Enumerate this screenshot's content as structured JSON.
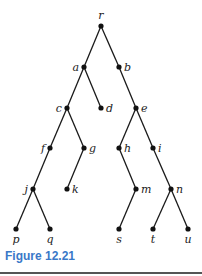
{
  "figure": {
    "caption": "Figure 12.21",
    "caption_color": "#3a78c8"
  },
  "tree": {
    "root": "r",
    "nodes": [
      {
        "id": "r",
        "x": 101,
        "y": 26,
        "label_pos": "above"
      },
      {
        "id": "a",
        "x": 84,
        "y": 67,
        "label_pos": "left"
      },
      {
        "id": "b",
        "x": 119,
        "y": 67,
        "label_pos": "right"
      },
      {
        "id": "c",
        "x": 67,
        "y": 108,
        "label_pos": "left"
      },
      {
        "id": "d",
        "x": 101,
        "y": 108,
        "label_pos": "right"
      },
      {
        "id": "e",
        "x": 136,
        "y": 108,
        "label_pos": "right"
      },
      {
        "id": "f",
        "x": 50,
        "y": 148,
        "label_pos": "left"
      },
      {
        "id": "g",
        "x": 84,
        "y": 148,
        "label_pos": "right"
      },
      {
        "id": "h",
        "x": 119,
        "y": 148,
        "label_pos": "right"
      },
      {
        "id": "i",
        "x": 153,
        "y": 148,
        "label_pos": "right"
      },
      {
        "id": "j",
        "x": 33,
        "y": 189,
        "label_pos": "left"
      },
      {
        "id": "k",
        "x": 67,
        "y": 189,
        "label_pos": "right"
      },
      {
        "id": "m",
        "x": 136,
        "y": 189,
        "label_pos": "right"
      },
      {
        "id": "n",
        "x": 171,
        "y": 189,
        "label_pos": "right"
      },
      {
        "id": "p",
        "x": 16,
        "y": 229,
        "label_pos": "below"
      },
      {
        "id": "q",
        "x": 50,
        "y": 229,
        "label_pos": "below"
      },
      {
        "id": "s",
        "x": 119,
        "y": 229,
        "label_pos": "below"
      },
      {
        "id": "t",
        "x": 153,
        "y": 229,
        "label_pos": "below"
      },
      {
        "id": "u",
        "x": 188,
        "y": 229,
        "label_pos": "below"
      }
    ],
    "edges": [
      [
        "r",
        "a"
      ],
      [
        "r",
        "b"
      ],
      [
        "a",
        "c"
      ],
      [
        "a",
        "d"
      ],
      [
        "b",
        "e"
      ],
      [
        "c",
        "f"
      ],
      [
        "c",
        "g"
      ],
      [
        "e",
        "h"
      ],
      [
        "e",
        "i"
      ],
      [
        "f",
        "j"
      ],
      [
        "g",
        "k"
      ],
      [
        "h",
        "m"
      ],
      [
        "i",
        "n"
      ],
      [
        "j",
        "p"
      ],
      [
        "j",
        "q"
      ],
      [
        "m",
        "s"
      ],
      [
        "n",
        "t"
      ],
      [
        "n",
        "u"
      ]
    ]
  }
}
